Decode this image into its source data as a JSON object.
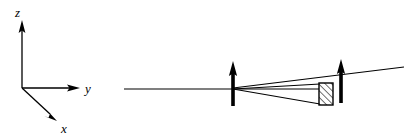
{
  "figure": {
    "kind": "optical-ray-diagram-with-coordinate-axes",
    "background_color": "#ffffff",
    "stroke_color": "#000000",
    "width": 418,
    "height": 138
  },
  "axes": {
    "name": "coordinate-axis-triad",
    "origin": {
      "x": 22,
      "y": 88
    },
    "z_label": "z",
    "y_label": "y",
    "x_label": "x",
    "z_label_pos": {
      "x": 18,
      "y": 14
    },
    "y_label_pos": {
      "x": 86,
      "y": 92
    },
    "x_label_pos": {
      "x": 63,
      "y": 131
    },
    "z_tip": {
      "x": 22,
      "y": 22
    },
    "y_tip": {
      "x": 79,
      "y": 88
    },
    "x_tip": {
      "x": 56,
      "y": 121
    }
  },
  "optics": {
    "name": "ray-diagram",
    "optical_axis": {
      "x1": 124,
      "y1": 89,
      "x2": 341,
      "y2": 89
    },
    "elements": [
      {
        "name": "first-arrow-element",
        "x": 233,
        "top_y": 62,
        "bottom_y": 106,
        "tip_y": 62,
        "stem_width": 3.6,
        "head_width": 8,
        "head_height": 16
      },
      {
        "name": "second-arrow-element",
        "x": 341,
        "top_y": 60,
        "bottom_y": 103,
        "tip_y": 60,
        "stem_width": 3.6,
        "head_width": 8,
        "head_height": 16
      }
    ],
    "block": {
      "name": "hatched-block",
      "x": 319,
      "y": 83,
      "width": 14,
      "height": 22,
      "hatch_direction": "lower-left-to-upper-right",
      "hatch_spacing": 3.2
    },
    "rays": [
      {
        "name": "incoming-axial-ray",
        "points": "124,89 233,89"
      },
      {
        "name": "upper-converging-ray",
        "points": "233,89 319,84"
      },
      {
        "name": "middle-converging-ray",
        "points": "233,89 319,89"
      },
      {
        "name": "lower-converging-ray",
        "points": "233,89 319,104"
      },
      {
        "name": "upper-outgoing-ray",
        "points": "233,88 402,68"
      },
      {
        "name": "exit-ray-to-edge",
        "points": "333,84 418,65"
      }
    ]
  }
}
